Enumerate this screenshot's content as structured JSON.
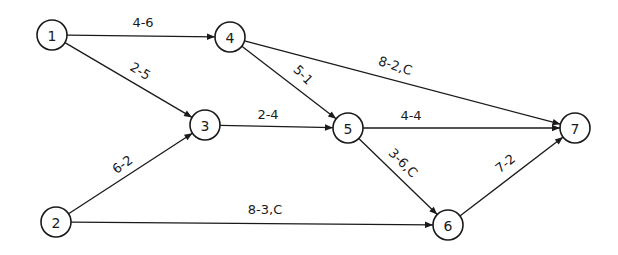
{
  "diagram": {
    "type": "activity-network",
    "nodes": [
      {
        "id": "1",
        "label": "1",
        "x": 52,
        "y": 35
      },
      {
        "id": "2",
        "label": "2",
        "x": 56,
        "y": 222
      },
      {
        "id": "3",
        "label": "3",
        "x": 205,
        "y": 125
      },
      {
        "id": "4",
        "label": "4",
        "x": 230,
        "y": 37
      },
      {
        "id": "5",
        "label": "5",
        "x": 348,
        "y": 128
      },
      {
        "id": "6",
        "label": "6",
        "x": 448,
        "y": 225
      },
      {
        "id": "7",
        "label": "7",
        "x": 575,
        "y": 128
      }
    ],
    "edges": [
      {
        "from": "1",
        "to": "4",
        "label": "4-6",
        "lx": 143,
        "ly": 27,
        "rot": 0
      },
      {
        "from": "1",
        "to": "3",
        "label": "2-5",
        "lx": 138,
        "ly": 75,
        "rot": 31
      },
      {
        "from": "2",
        "to": "3",
        "label": "6-2",
        "lx": 125,
        "ly": 168,
        "rot": -36
      },
      {
        "from": "3",
        "to": "5",
        "label": "2-4",
        "lx": 268,
        "ly": 119,
        "rot": 0
      },
      {
        "from": "4",
        "to": "5",
        "label": "5-1",
        "lx": 300,
        "ly": 78,
        "rot": 45
      },
      {
        "from": "4",
        "to": "7",
        "label": "8-2,C",
        "lx": 394,
        "ly": 70,
        "rot": 18
      },
      {
        "from": "5",
        "to": "7",
        "label": "4-4",
        "lx": 411,
        "ly": 120,
        "rot": 0
      },
      {
        "from": "5",
        "to": "6",
        "label": "3-6,C",
        "lx": 400,
        "ly": 166,
        "rot": 45
      },
      {
        "from": "2",
        "to": "6",
        "label": "8-3,C",
        "lx": 265,
        "ly": 214,
        "rot": 0
      },
      {
        "from": "6",
        "to": "7",
        "label": "7-2",
        "lx": 508,
        "ly": 167,
        "rot": -38
      }
    ]
  }
}
